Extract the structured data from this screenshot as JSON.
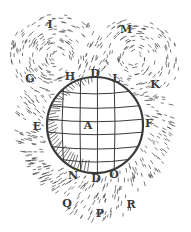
{
  "figure": {
    "ink_color": "#3a3a3a",
    "paper_color": "#ffffff",
    "sphere": {
      "cx": 95,
      "cy": 125,
      "r": 48
    },
    "labels": [
      {
        "text": "I",
        "x": 50,
        "y": 24
      },
      {
        "text": "M",
        "x": 126,
        "y": 29
      },
      {
        "text": "G",
        "x": 30,
        "y": 78
      },
      {
        "text": "H",
        "x": 70,
        "y": 76
      },
      {
        "text": "D",
        "x": 95,
        "y": 73
      },
      {
        "text": "L",
        "x": 116,
        "y": 78
      },
      {
        "text": "K",
        "x": 155,
        "y": 84
      },
      {
        "text": "E",
        "x": 37,
        "y": 126
      },
      {
        "text": "A",
        "x": 88,
        "y": 125
      },
      {
        "text": "F",
        "x": 149,
        "y": 123
      },
      {
        "text": "N",
        "x": 73,
        "y": 175
      },
      {
        "text": "D",
        "x": 96,
        "y": 178
      },
      {
        "text": "O",
        "x": 114,
        "y": 174
      },
      {
        "text": "Q",
        "x": 67,
        "y": 203
      },
      {
        "text": "P",
        "x": 100,
        "y": 213
      },
      {
        "text": "R",
        "x": 131,
        "y": 204
      }
    ]
  }
}
